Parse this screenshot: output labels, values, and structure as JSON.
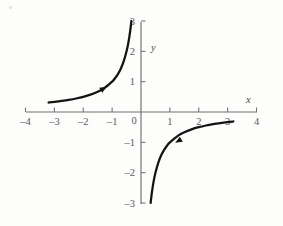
{
  "chart_data": {
    "type": "line",
    "title": "",
    "subtitle": "",
    "xlabel": "x",
    "ylabel": "y",
    "xlim": [
      -4,
      4
    ],
    "ylim": [
      -3,
      3
    ],
    "xticks": [
      -4,
      -3,
      -2,
      -1,
      0,
      1,
      2,
      3,
      4
    ],
    "xtick_labels": [
      "–4",
      "–3",
      "–2",
      "–1",
      "0",
      "1",
      "2",
      "3",
      "4"
    ],
    "yticks": [
      -3,
      -2,
      -1,
      1,
      2,
      3
    ],
    "ytick_labels": [
      "–3",
      "–2",
      "–1",
      "1",
      "2",
      "3"
    ],
    "grid": false,
    "legend": null,
    "function": "y = -1/x",
    "series": [
      {
        "name": "upper-left-branch",
        "domain": [
          -3.2,
          -0.333
        ],
        "points": [
          {
            "x": -3.2,
            "y": 0.3125
          },
          {
            "x": -3.0,
            "y": 0.3333
          },
          {
            "x": -2.75,
            "y": 0.3636
          },
          {
            "x": -2.5,
            "y": 0.4
          },
          {
            "x": -2.25,
            "y": 0.4444
          },
          {
            "x": -2.0,
            "y": 0.5
          },
          {
            "x": -1.75,
            "y": 0.5714
          },
          {
            "x": -1.5,
            "y": 0.6667
          },
          {
            "x": -1.3,
            "y": 0.7692
          },
          {
            "x": -1.25,
            "y": 0.8
          },
          {
            "x": -1.0,
            "y": 1.0
          },
          {
            "x": -0.9,
            "y": 1.1111
          },
          {
            "x": -0.8,
            "y": 1.25
          },
          {
            "x": -0.7,
            "y": 1.4286
          },
          {
            "x": -0.6,
            "y": 1.6667
          },
          {
            "x": -0.5,
            "y": 2.0
          },
          {
            "x": -0.45,
            "y": 2.2222
          },
          {
            "x": -0.4,
            "y": 2.5
          },
          {
            "x": -0.36,
            "y": 2.7778
          },
          {
            "x": -0.333,
            "y": 3.0
          }
        ],
        "arrow": {
          "x": -1.3,
          "y": 0.77,
          "direction": "up-right"
        }
      },
      {
        "name": "lower-right-branch",
        "domain": [
          0.333,
          3.2
        ],
        "points": [
          {
            "x": 0.333,
            "y": -3.0
          },
          {
            "x": 0.36,
            "y": -2.7778
          },
          {
            "x": 0.4,
            "y": -2.5
          },
          {
            "x": 0.45,
            "y": -2.2222
          },
          {
            "x": 0.5,
            "y": -2.0
          },
          {
            "x": 0.6,
            "y": -1.6667
          },
          {
            "x": 0.7,
            "y": -1.4286
          },
          {
            "x": 0.8,
            "y": -1.25
          },
          {
            "x": 0.9,
            "y": -1.1111
          },
          {
            "x": 1.0,
            "y": -1.0
          },
          {
            "x": 1.3,
            "y": -0.7692
          },
          {
            "x": 1.5,
            "y": -0.6667
          },
          {
            "x": 1.75,
            "y": -0.5714
          },
          {
            "x": 2.0,
            "y": -0.5
          },
          {
            "x": 2.25,
            "y": -0.4444
          },
          {
            "x": 2.5,
            "y": -0.4
          },
          {
            "x": 2.75,
            "y": -0.3636
          },
          {
            "x": 3.0,
            "y": -0.3333
          },
          {
            "x": 3.2,
            "y": -0.3125
          }
        ],
        "arrow": {
          "x": 1.3,
          "y": -0.95,
          "direction": "left"
        }
      }
    ],
    "colors": {
      "curve": "#141414",
      "axis": "#6f7072",
      "tick_label": "#58595b",
      "background": "#fdfdfb"
    }
  },
  "labels": {
    "x_axis_name": "x",
    "y_axis_name": "y",
    "origin_label": "0"
  },
  "xtick_display": [
    {
      "value": -4,
      "label": "–4"
    },
    {
      "value": -3,
      "label": "–3"
    },
    {
      "value": -2,
      "label": "–2"
    },
    {
      "value": -1,
      "label": "–1"
    },
    {
      "value": 1,
      "label": "1"
    },
    {
      "value": 2,
      "label": "2"
    },
    {
      "value": 3,
      "label": "3"
    },
    {
      "value": 4,
      "label": "4"
    }
  ],
  "ytick_display": [
    {
      "value": 3,
      "label": "3"
    },
    {
      "value": 2,
      "label": "2"
    },
    {
      "value": 1,
      "label": "1"
    },
    {
      "value": -1,
      "label": "–1"
    },
    {
      "value": -2,
      "label": "–2"
    },
    {
      "value": -3,
      "label": "–3"
    }
  ],
  "footer": {
    "caption_faint": ""
  }
}
